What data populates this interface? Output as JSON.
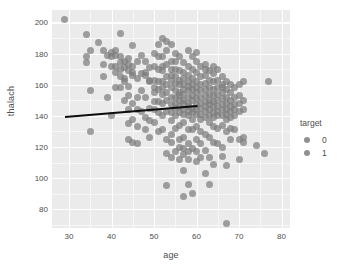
{
  "chart_data": {
    "type": "scatter",
    "title": "",
    "xlabel": "age",
    "ylabel": "thalach",
    "xlim": [
      26,
      82
    ],
    "ylim": [
      68,
      208
    ],
    "xticks": [
      30,
      40,
      50,
      60,
      70,
      80
    ],
    "yticks": [
      80,
      100,
      120,
      140,
      160,
      180,
      200
    ],
    "xticklabels": [
      "30",
      "40",
      "50",
      "60",
      "70",
      "80"
    ],
    "yticklabels": [
      "80",
      "100",
      "120",
      "140",
      "160",
      "180",
      "200"
    ],
    "grid": true,
    "grid_major_color": "#ffffff",
    "grid_minor_color": "#f7f7f7",
    "panel_color": "#ebebeb",
    "figure_color": "#ffffff",
    "point_color": "#7d7d7d",
    "point_opacity": 0.72,
    "legend": {
      "title": "target",
      "position": "right",
      "entries": [
        {
          "label": "0",
          "color": "#7d7d7d"
        },
        {
          "label": "1",
          "color": "#7d7d7d"
        }
      ]
    },
    "trendline": {
      "type": "linear-fit",
      "color": "#0d0d0d",
      "x": [
        29.0,
        60.2
      ],
      "y": [
        140.2,
        147.3
      ]
    },
    "points": [
      [
        29,
        202
      ],
      [
        34,
        192
      ],
      [
        34,
        178
      ],
      [
        34,
        174
      ],
      [
        35,
        182
      ],
      [
        35,
        156
      ],
      [
        35,
        130
      ],
      [
        37,
        187
      ],
      [
        38,
        182
      ],
      [
        38,
        173
      ],
      [
        39,
        179
      ],
      [
        39,
        152
      ],
      [
        40,
        181
      ],
      [
        40,
        178
      ],
      [
        40,
        172
      ],
      [
        40,
        140
      ],
      [
        41,
        172
      ],
      [
        41,
        168
      ],
      [
        41,
        179
      ],
      [
        41,
        182
      ],
      [
        41,
        158
      ],
      [
        42,
        193
      ],
      [
        42,
        178
      ],
      [
        42,
        174
      ],
      [
        42,
        165
      ],
      [
        42,
        170
      ],
      [
        43,
        171
      ],
      [
        43,
        164
      ],
      [
        43,
        162
      ],
      [
        43,
        175
      ],
      [
        43,
        150
      ],
      [
        44,
        177
      ],
      [
        44,
        173
      ],
      [
        44,
        169
      ],
      [
        44,
        159
      ],
      [
        44,
        153
      ],
      [
        44,
        144
      ],
      [
        44,
        135
      ],
      [
        45,
        185
      ],
      [
        45,
        168
      ],
      [
        45,
        166
      ],
      [
        45,
        148
      ],
      [
        45,
        138
      ],
      [
        46,
        175
      ],
      [
        46,
        164
      ],
      [
        46,
        152
      ],
      [
        46,
        144
      ],
      [
        46,
        133
      ],
      [
        47,
        179
      ],
      [
        47,
        156
      ],
      [
        47,
        143
      ],
      [
        48,
        175
      ],
      [
        48,
        168
      ],
      [
        48,
        166
      ],
      [
        48,
        152
      ],
      [
        48,
        139
      ],
      [
        49,
        171
      ],
      [
        49,
        163
      ],
      [
        49,
        162
      ],
      [
        49,
        145
      ],
      [
        49,
        126
      ],
      [
        50,
        180
      ],
      [
        50,
        163
      ],
      [
        50,
        158
      ],
      [
        50,
        155
      ],
      [
        50,
        149
      ],
      [
        50,
        144
      ],
      [
        51,
        178
      ],
      [
        51,
        170
      ],
      [
        51,
        162
      ],
      [
        51,
        157
      ],
      [
        51,
        149
      ],
      [
        51,
        142
      ],
      [
        51,
        130
      ],
      [
        52,
        190
      ],
      [
        52,
        178
      ],
      [
        52,
        172
      ],
      [
        52,
        169
      ],
      [
        52,
        162
      ],
      [
        52,
        158
      ],
      [
        52,
        154
      ],
      [
        52,
        148
      ],
      [
        52,
        140
      ],
      [
        53,
        182
      ],
      [
        53,
        173
      ],
      [
        53,
        165
      ],
      [
        53,
        160
      ],
      [
        53,
        155
      ],
      [
        53,
        150
      ],
      [
        53,
        143
      ],
      [
        53,
        125
      ],
      [
        53,
        116
      ],
      [
        53,
        95
      ],
      [
        54,
        186
      ],
      [
        54,
        175
      ],
      [
        54,
        170
      ],
      [
        54,
        166
      ],
      [
        54,
        163
      ],
      [
        54,
        158
      ],
      [
        54,
        152
      ],
      [
        54,
        147
      ],
      [
        54,
        142
      ],
      [
        54,
        137
      ],
      [
        54,
        123
      ],
      [
        54,
        113
      ],
      [
        55,
        180
      ],
      [
        55,
        170
      ],
      [
        55,
        165
      ],
      [
        55,
        161
      ],
      [
        55,
        156
      ],
      [
        55,
        152
      ],
      [
        55,
        148
      ],
      [
        55,
        145
      ],
      [
        55,
        140
      ],
      [
        55,
        132
      ],
      [
        55,
        117
      ],
      [
        56,
        178
      ],
      [
        56,
        169
      ],
      [
        56,
        163
      ],
      [
        56,
        160
      ],
      [
        56,
        155
      ],
      [
        56,
        153
      ],
      [
        56,
        150
      ],
      [
        56,
        146
      ],
      [
        56,
        142
      ],
      [
        56,
        134
      ],
      [
        56,
        125
      ],
      [
        56,
        112
      ],
      [
        57,
        174
      ],
      [
        57,
        168
      ],
      [
        57,
        164
      ],
      [
        57,
        160
      ],
      [
        57,
        157
      ],
      [
        57,
        154
      ],
      [
        57,
        150
      ],
      [
        57,
        148
      ],
      [
        57,
        144
      ],
      [
        57,
        141
      ],
      [
        57,
        136
      ],
      [
        57,
        126
      ],
      [
        57,
        115
      ],
      [
        57,
        105
      ],
      [
        57,
        88
      ],
      [
        58,
        172
      ],
      [
        58,
        166
      ],
      [
        58,
        162
      ],
      [
        58,
        159
      ],
      [
        58,
        156
      ],
      [
        58,
        152
      ],
      [
        58,
        148
      ],
      [
        58,
        146
      ],
      [
        58,
        143
      ],
      [
        58,
        140
      ],
      [
        58,
        131
      ],
      [
        58,
        122
      ],
      [
        58,
        112
      ],
      [
        58,
        96
      ],
      [
        59,
        178
      ],
      [
        59,
        170
      ],
      [
        59,
        164
      ],
      [
        59,
        160
      ],
      [
        59,
        157
      ],
      [
        59,
        153
      ],
      [
        59,
        150
      ],
      [
        59,
        145
      ],
      [
        59,
        142
      ],
      [
        59,
        138
      ],
      [
        59,
        131
      ],
      [
        59,
        119
      ],
      [
        59,
        90
      ],
      [
        60,
        175
      ],
      [
        60,
        168
      ],
      [
        60,
        162
      ],
      [
        60,
        158
      ],
      [
        60,
        155
      ],
      [
        60,
        151
      ],
      [
        60,
        147
      ],
      [
        60,
        144
      ],
      [
        60,
        141
      ],
      [
        60,
        133
      ],
      [
        60,
        125
      ],
      [
        60,
        117
      ],
      [
        60,
        111
      ],
      [
        61,
        172
      ],
      [
        61,
        165
      ],
      [
        61,
        160
      ],
      [
        61,
        156
      ],
      [
        61,
        152
      ],
      [
        61,
        148
      ],
      [
        61,
        145
      ],
      [
        61,
        141
      ],
      [
        61,
        138
      ],
      [
        61,
        130
      ],
      [
        61,
        122
      ],
      [
        61,
        113
      ],
      [
        62,
        173
      ],
      [
        62,
        166
      ],
      [
        62,
        161
      ],
      [
        62,
        157
      ],
      [
        62,
        153
      ],
      [
        62,
        149
      ],
      [
        62,
        146
      ],
      [
        62,
        143
      ],
      [
        62,
        139
      ],
      [
        62,
        128
      ],
      [
        62,
        118
      ],
      [
        62,
        103
      ],
      [
        63,
        169
      ],
      [
        63,
        163
      ],
      [
        63,
        158
      ],
      [
        63,
        154
      ],
      [
        63,
        150
      ],
      [
        63,
        147
      ],
      [
        63,
        144
      ],
      [
        63,
        140
      ],
      [
        63,
        136
      ],
      [
        63,
        126
      ],
      [
        63,
        113
      ],
      [
        63,
        96
      ],
      [
        64,
        167
      ],
      [
        64,
        162
      ],
      [
        64,
        157
      ],
      [
        64,
        153
      ],
      [
        64,
        149
      ],
      [
        64,
        146
      ],
      [
        64,
        142
      ],
      [
        64,
        139
      ],
      [
        64,
        133
      ],
      [
        64,
        123
      ],
      [
        64,
        109
      ],
      [
        65,
        170
      ],
      [
        65,
        163
      ],
      [
        65,
        158
      ],
      [
        65,
        154
      ],
      [
        65,
        150
      ],
      [
        65,
        146
      ],
      [
        65,
        143
      ],
      [
        65,
        140
      ],
      [
        65,
        132
      ],
      [
        65,
        122
      ],
      [
        66,
        165
      ],
      [
        66,
        160
      ],
      [
        66,
        155
      ],
      [
        66,
        151
      ],
      [
        66,
        147
      ],
      [
        66,
        144
      ],
      [
        66,
        140
      ],
      [
        66,
        134
      ],
      [
        66,
        120
      ],
      [
        66,
        114
      ],
      [
        67,
        162
      ],
      [
        67,
        157
      ],
      [
        67,
        152
      ],
      [
        67,
        148
      ],
      [
        67,
        144
      ],
      [
        67,
        141
      ],
      [
        67,
        138
      ],
      [
        67,
        130
      ],
      [
        67,
        108
      ],
      [
        67,
        71
      ],
      [
        68,
        160
      ],
      [
        68,
        155
      ],
      [
        68,
        150
      ],
      [
        68,
        146
      ],
      [
        68,
        143
      ],
      [
        68,
        139
      ],
      [
        68,
        132
      ],
      [
        68,
        125
      ],
      [
        69,
        158
      ],
      [
        69,
        152
      ],
      [
        69,
        147
      ],
      [
        69,
        144
      ],
      [
        69,
        140
      ],
      [
        69,
        131
      ],
      [
        70,
        160
      ],
      [
        70,
        153
      ],
      [
        70,
        148
      ],
      [
        70,
        143
      ],
      [
        70,
        125
      ],
      [
        70,
        112
      ],
      [
        71,
        162
      ],
      [
        71,
        150
      ],
      [
        71,
        144
      ],
      [
        71,
        126
      ],
      [
        71,
        123
      ],
      [
        74,
        121
      ],
      [
        76,
        116
      ],
      [
        77,
        162
      ],
      [
        38,
        165
      ],
      [
        42,
        158
      ],
      [
        45,
        172
      ],
      [
        47,
        167
      ],
      [
        50,
        172
      ],
      [
        51,
        186
      ],
      [
        53,
        188
      ],
      [
        55,
        175
      ],
      [
        58,
        182
      ],
      [
        60,
        181
      ],
      [
        62,
        170
      ],
      [
        64,
        172
      ],
      [
        66,
        158
      ],
      [
        44,
        125
      ],
      [
        45,
        123
      ],
      [
        46,
        122
      ],
      [
        52,
        131
      ],
      [
        54,
        128
      ],
      [
        56,
        120
      ],
      [
        57,
        119
      ],
      [
        58,
        117
      ],
      [
        48,
        131
      ],
      [
        49,
        137
      ],
      [
        50,
        136
      ]
    ]
  }
}
